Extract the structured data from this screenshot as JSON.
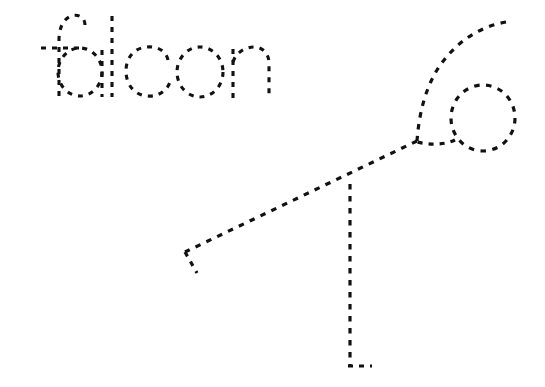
{
  "worksheet": {
    "type": "tracing-worksheet",
    "background_color": "#ffffff",
    "stroke_color": "#111111",
    "width": 545,
    "height": 387,
    "word": {
      "text": "falcon",
      "style": "dashed-outline-lowercase",
      "letters": [
        {
          "char": "f",
          "name": "letter-f"
        },
        {
          "char": "a",
          "name": "letter-a"
        },
        {
          "char": "l",
          "name": "letter-l"
        },
        {
          "char": "c",
          "name": "letter-c"
        },
        {
          "char": "o",
          "name": "letter-o"
        },
        {
          "char": "n",
          "name": "letter-n"
        }
      ]
    },
    "drawing": {
      "subject": "falcon",
      "style": "dashed-outline-line-drawing",
      "parts": [
        {
          "label": "head-loop",
          "name": "falcon-head-loop"
        },
        {
          "label": "back-curve",
          "name": "falcon-back-curve"
        },
        {
          "label": "body-diagonal",
          "name": "falcon-body-diagonal"
        },
        {
          "label": "tail-tip",
          "name": "falcon-tail-tip"
        },
        {
          "label": "leg",
          "name": "falcon-leg"
        },
        {
          "label": "foot",
          "name": "falcon-foot"
        },
        {
          "label": "beak",
          "name": "falcon-beak"
        }
      ]
    }
  }
}
